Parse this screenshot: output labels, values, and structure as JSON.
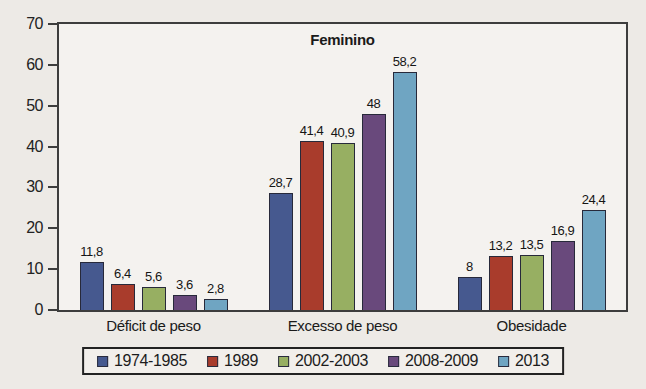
{
  "chart_data": {
    "type": "bar",
    "title": "Feminino",
    "categories": [
      "Déficit de peso",
      "Excesso de peso",
      "Obesidade"
    ],
    "series": [
      {
        "name": "1974-1985",
        "color": "#46598f",
        "values": [
          11.8,
          6.4,
          5.6
        ],
        "labels": [
          "11,8",
          "28,7",
          "8"
        ],
        "all_values": [
          11.8,
          28.7,
          8
        ],
        "value_labels": [
          "11,8",
          "28,7",
          "8"
        ]
      },
      {
        "name": "1989",
        "color": "#a93c2c",
        "values": [
          6.4,
          41.4,
          13.2
        ],
        "all_values": [
          6.4,
          41.4,
          13.2
        ],
        "value_labels": [
          "6,4",
          "41,4",
          "13,2"
        ]
      },
      {
        "name": "2002-2003",
        "color": "#97af62",
        "values": [
          5.6,
          40.9,
          13.5
        ],
        "all_values": [
          5.6,
          40.9,
          13.5
        ],
        "value_labels": [
          "5,6",
          "40,9",
          "13,5"
        ]
      },
      {
        "name": "2008-2009",
        "color": "#69497c",
        "values": [
          3.6,
          48,
          16.9
        ],
        "all_values": [
          3.6,
          48,
          16.9
        ],
        "value_labels": [
          "3,6",
          "48",
          "16,9"
        ]
      },
      {
        "name": "2013",
        "color": "#6fa5c2",
        "values": [
          2.8,
          58.2,
          24.4
        ],
        "all_values": [
          2.8,
          58.2,
          24.4
        ],
        "value_labels": [
          "2,8",
          "58,2",
          "24,4"
        ]
      }
    ],
    "ylim": [
      0,
      70
    ],
    "yticks": [
      0,
      10,
      20,
      30,
      40,
      50,
      60,
      70
    ],
    "grid": false,
    "legend_position": "bottom",
    "axis_color": "#3d3d3d",
    "plot_background": "#f4f2ef",
    "page_background": "#edeae6"
  }
}
